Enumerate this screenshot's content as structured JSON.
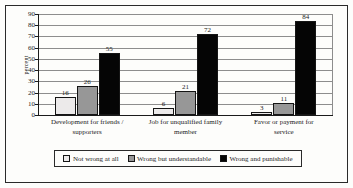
{
  "chart_data": {
    "type": "bar",
    "title": "",
    "xlabel": "",
    "ylabel": "percent",
    "ylim": [
      0,
      90
    ],
    "ytick_step": 10,
    "yticks": [
      0,
      10,
      20,
      30,
      40,
      50,
      60,
      70,
      80,
      90
    ],
    "grid": true,
    "legend_position": "bottom",
    "categories": [
      "Development for friends / supporters",
      "Job for unqualified family member",
      "Favor or payment for service"
    ],
    "category_lines": [
      [
        "Development for friends /",
        "supporters"
      ],
      [
        "Job for unqualified family",
        "member"
      ],
      [
        "Favor or payment for",
        "service"
      ]
    ],
    "series": [
      {
        "name": "Not wrong at all",
        "color": "#eceaea",
        "values": [
          16,
          6,
          3
        ]
      },
      {
        "name": "Wrong but understandable",
        "color": "#979797",
        "values": [
          26,
          21,
          11
        ]
      },
      {
        "name": "Wrong and punishable",
        "color": "#050505",
        "values": [
          55,
          72,
          84
        ]
      }
    ]
  },
  "axis": {
    "y_title": "percent",
    "y_tick_labels": [
      "0",
      "10",
      "20",
      "30",
      "40",
      "50",
      "60",
      "70",
      "80",
      "90"
    ]
  },
  "legend": {
    "items": [
      {
        "label": "Not wrong at all",
        "swatch": "#eceaea"
      },
      {
        "label": "Wrong but understandable",
        "swatch": "#979797"
      },
      {
        "label": "Wrong and punishable",
        "swatch": "#050505"
      }
    ]
  }
}
